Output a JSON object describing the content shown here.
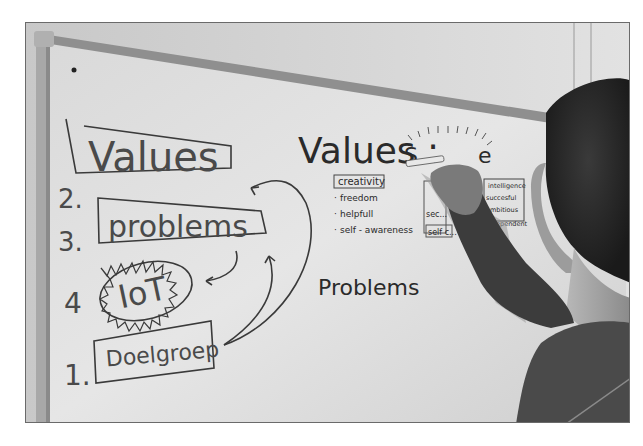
{
  "photo": {
    "description": "Person writing on a whiteboard with a hand-drawn process diagram",
    "left_diagram": {
      "steps": [
        {
          "number": "2.",
          "label": "Values"
        },
        {
          "number": "3.",
          "label": "problems"
        },
        {
          "number": "4",
          "label": "IoT"
        },
        {
          "number": "1.",
          "label": "Doelgroep"
        }
      ]
    },
    "right_notes": {
      "heading_values": "Values :",
      "partial_word": "S",
      "partial_word_end": "e",
      "values_list": [
        "creativity",
        "freedom",
        "helpfull",
        "self - awareness"
      ],
      "middle_list": [
        "...",
        "sec...",
        "s...",
        "self c..."
      ],
      "right_list": [
        "intelligence",
        "succesful",
        "ambitious",
        "independent"
      ],
      "heading_problems": "Problems"
    },
    "colors": {
      "board": "#d8d8d8",
      "ink": "#2a2a2a",
      "frame": "#8a8a8a"
    }
  }
}
